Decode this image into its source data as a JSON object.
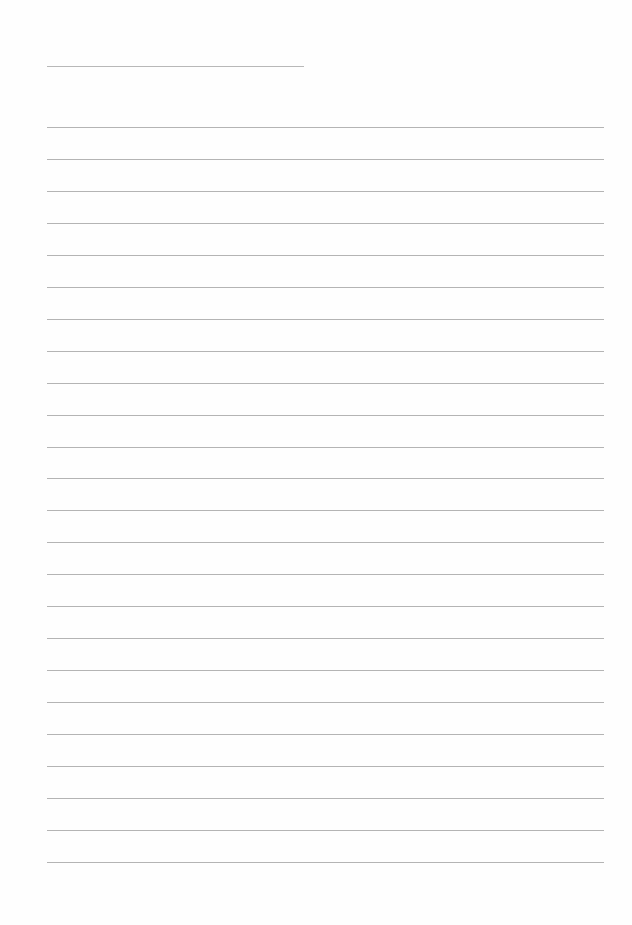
{
  "page": {
    "type": "blank-lined-sheet",
    "background_color": "#fefefe",
    "line_color": "#b4b4b4"
  },
  "title_line": {
    "x": 47,
    "y": 66,
    "width": 257,
    "text": ""
  },
  "ruled_lines": {
    "count": 24,
    "x": 47,
    "width": 557,
    "first_y": 127,
    "spacing": 31.95,
    "entries": [
      "",
      "",
      "",
      "",
      "",
      "",
      "",
      "",
      "",
      "",
      "",
      "",
      "",
      "",
      "",
      "",
      "",
      "",
      "",
      "",
      "",
      "",
      "",
      ""
    ]
  }
}
